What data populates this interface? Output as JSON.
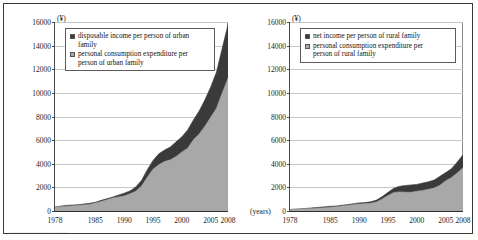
{
  "document": {
    "cut_off_footer_text": "................................."
  },
  "charts": [
    {
      "id": "urban",
      "unit_label": "(¥)",
      "years_label": "",
      "legend": [
        {
          "label_line1": "disposable income per person of urban",
          "label_line2": "family",
          "color": "#3a3a3a",
          "name": "disposable-income-urban"
        },
        {
          "label_line1": "personal consumption expenditure per",
          "label_line2": "person of urban family",
          "color": "#a8a8a8",
          "name": "consumption-expenditure-urban"
        }
      ],
      "chart_data": {
        "type": "area",
        "title": "",
        "xlabel": "(years)",
        "ylabel": "(¥)",
        "ylim": [
          0,
          16000
        ],
        "ytick_step": 2000,
        "yticks": [
          0,
          2000,
          4000,
          6000,
          8000,
          10000,
          12000,
          14000,
          16000
        ],
        "xlim": [
          1978,
          2008
        ],
        "xticks": [
          1978,
          1985,
          1990,
          1995,
          2000,
          2005,
          2008
        ],
        "grid": true,
        "legend_position": "upper-left-inside",
        "x": [
          1978,
          1980,
          1982,
          1984,
          1985,
          1986,
          1988,
          1990,
          1991,
          1992,
          1993,
          1994,
          1995,
          1996,
          1997,
          1998,
          1999,
          2000,
          2001,
          2002,
          2003,
          2004,
          2005,
          2006,
          2007,
          2008
        ],
        "series": [
          {
            "name": "disposable income per person of urban family",
            "color": "#3a3a3a",
            "values": [
              343,
              478,
              535,
              652,
              739,
              900,
              1181,
              1510,
              1701,
              2027,
              2577,
              3496,
              4283,
              4839,
              5160,
              5425,
              5854,
              6280,
              6860,
              7703,
              8472,
              9422,
              10493,
              11760,
              13786,
              15781
            ]
          },
          {
            "name": "personal consumption expenditure per person of urban family",
            "color": "#a8a8a8",
            "values": [
              311,
              412,
              471,
              559,
              673,
              799,
              1104,
              1279,
              1454,
              1672,
              2111,
              2851,
              3538,
              3919,
              4186,
              4332,
              4616,
              4998,
              5309,
              6030,
              6511,
              7182,
              7943,
              8697,
              9997,
              11243
            ]
          }
        ]
      }
    },
    {
      "id": "rural",
      "unit_label": "(¥)",
      "years_label": "(years)",
      "legend": [
        {
          "label_line1": "net income per person of rural family",
          "label_line2": "",
          "color": "#3a3a3a",
          "name": "net-income-rural"
        },
        {
          "label_line1": "personal consumption expenditure per",
          "label_line2": "person of rural family",
          "color": "#a8a8a8",
          "name": "consumption-expenditure-rural"
        }
      ],
      "chart_data": {
        "type": "area",
        "title": "",
        "xlabel": "(years)",
        "ylabel": "(¥)",
        "ylim": [
          0,
          16000
        ],
        "ytick_step": 2000,
        "yticks": [
          0,
          2000,
          4000,
          6000,
          8000,
          10000,
          12000,
          14000,
          16000
        ],
        "xlim": [
          1978,
          2008
        ],
        "xticks": [
          1978,
          1985,
          1990,
          1995,
          2000,
          2005,
          2008
        ],
        "grid": true,
        "legend_position": "upper-left-inside",
        "x": [
          1978,
          1980,
          1982,
          1984,
          1985,
          1986,
          1988,
          1990,
          1991,
          1992,
          1993,
          1994,
          1995,
          1996,
          1997,
          1998,
          1999,
          2000,
          2001,
          2002,
          2003,
          2004,
          2005,
          2006,
          2007,
          2008
        ],
        "series": [
          {
            "name": "net income per person of rural family",
            "color": "#3a3a3a",
            "values": [
              134,
              191,
              270,
              355,
              398,
              424,
              545,
              686,
              709,
              784,
              922,
              1221,
              1578,
              1926,
              2090,
              2162,
              2210,
              2253,
              2366,
              2476,
              2622,
              2936,
              3255,
              3587,
              4140,
              4761
            ]
          },
          {
            "name": "personal consumption expenditure per person of rural family",
            "color": "#a8a8a8",
            "values": [
              116,
              162,
              220,
              273,
              317,
              357,
              477,
              585,
              620,
              659,
              770,
              1017,
              1310,
              1572,
              1617,
              1590,
              1577,
              1670,
              1741,
              1834,
              1943,
              2185,
              2555,
              2829,
              3224,
              3661
            ]
          }
        ]
      }
    }
  ]
}
